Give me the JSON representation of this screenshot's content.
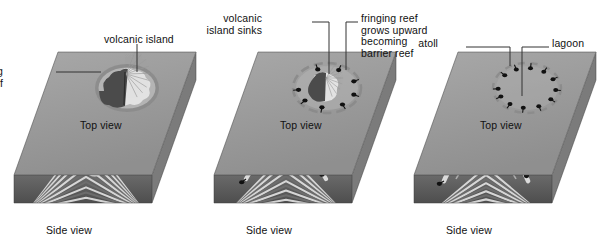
{
  "figure": {
    "background": "#ffffff",
    "width": 614,
    "height": 245
  },
  "palette": {
    "seafloor_top": "#9a9a9a",
    "seafloor_top_light": "#a8a8a8",
    "seafloor_front": "#5d5d5d",
    "seafloor_side": "#7b7b7b",
    "water_fill": "#b4b4b4",
    "island_light": "#e2e2e2",
    "island_shadow": "#4b4b4b",
    "reef_ring": "#8a8a8a",
    "coral_marker": "#111111",
    "strata_light": "#dcdcdc",
    "strata_dark": "#6e6e6e",
    "leader_line": "#333333",
    "text": "#111111"
  },
  "stages": [
    {
      "id": "stage-1-fringing-reef",
      "index": 1,
      "offset_x": 0,
      "top_view_label": "Top view",
      "side_view_label": "Side view",
      "callouts": [
        {
          "name": "volcanic-island",
          "text": "volcanic island",
          "align": "left",
          "x": 104,
          "y": 34
        },
        {
          "name": "fringing-coral-reef",
          "text": "fringing\ncoral reef",
          "align": "right",
          "x": 3,
          "y": 66
        }
      ]
    },
    {
      "id": "stage-2-barrier-reef",
      "index": 2,
      "offset_x": 200,
      "top_view_label": "Top view",
      "side_view_label": "Side view",
      "callouts": [
        {
          "name": "volcanic-island-sinks",
          "text": "volcanic\nisland sinks",
          "align": "right",
          "x": 62,
          "y": 13
        },
        {
          "name": "fringing-reef-grows-upward",
          "text": "fringing reef\ngrows upward\nbecoming\nbarrier reef",
          "align": "left",
          "x": 161,
          "y": 13
        }
      ]
    },
    {
      "id": "stage-3-atoll",
      "index": 3,
      "offset_x": 400,
      "top_view_label": "Top view",
      "side_view_label": "Side view",
      "callouts": [
        {
          "name": "atoll",
          "text": "atoll",
          "align": "right",
          "x": 38,
          "y": 38
        },
        {
          "name": "lagoon",
          "text": "lagoon",
          "align": "left",
          "x": 152,
          "y": 38
        }
      ]
    }
  ],
  "diagram_content": {
    "type": "process-diagram",
    "sequence": [
      "fringing reef around volcanic island",
      "barrier reef as island sinks",
      "atoll with central lagoon"
    ]
  }
}
